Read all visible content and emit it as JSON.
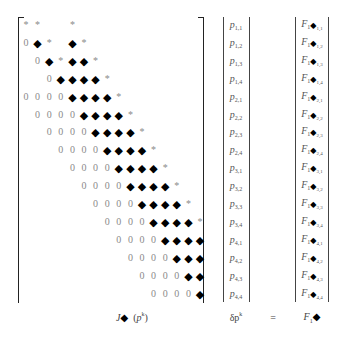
{
  "matrix": {
    "name": "J",
    "rows": [
      {
        "start": 0,
        "cells": [
          "*",
          "*",
          "",
          "",
          "*"
        ]
      },
      {
        "start": 0,
        "cells": [
          "0",
          "◆",
          "*",
          "",
          "◆",
          "*"
        ]
      },
      {
        "start": 1,
        "cells": [
          "0",
          "◆",
          "*",
          "◆",
          "◆",
          "*"
        ]
      },
      {
        "start": 2,
        "cells": [
          "0",
          "◆",
          "◆",
          "◆",
          "◆",
          "*"
        ]
      },
      {
        "start": 0,
        "cells": [
          "0",
          "0",
          "0",
          "0",
          "◆",
          "◆",
          "◆",
          "◆",
          "*"
        ]
      },
      {
        "start": 1,
        "cells": [
          "0",
          "0",
          "0",
          "0",
          "◆",
          "◆",
          "◆",
          "◆",
          "*"
        ]
      },
      {
        "start": 2,
        "cells": [
          "0",
          "0",
          "0",
          "0",
          "◆",
          "◆",
          "◆",
          "◆",
          "*"
        ]
      },
      {
        "start": 3,
        "cells": [
          "0",
          "0",
          "0",
          "0",
          "◆",
          "◆",
          "◆",
          "◆",
          "*"
        ]
      },
      {
        "start": 4,
        "cells": [
          "0",
          "0",
          "0",
          "0",
          "◆",
          "◆",
          "◆",
          "◆",
          "*"
        ]
      },
      {
        "start": 5,
        "cells": [
          "0",
          "0",
          "0",
          "0",
          "◆",
          "◆",
          "◆",
          "◆",
          "*"
        ]
      },
      {
        "start": 6,
        "cells": [
          "0",
          "0",
          "0",
          "0",
          "◆",
          "◆",
          "◆",
          "◆",
          "*"
        ]
      },
      {
        "start": 7,
        "cells": [
          "0",
          "0",
          "0",
          "0",
          "◆",
          "◆",
          "◆",
          "◆",
          "*"
        ]
      },
      {
        "start": 8,
        "cells": [
          "0",
          "0",
          "0",
          "0",
          "◆",
          "◆",
          "◆",
          "◆"
        ]
      },
      {
        "start": 9,
        "cells": [
          "0",
          "0",
          "0",
          "0",
          "◆",
          "◆",
          "◆"
        ]
      },
      {
        "start": 10,
        "cells": [
          "0",
          "0",
          "0",
          "0",
          "◆",
          "◆"
        ]
      },
      {
        "start": 11,
        "cells": [
          "0",
          "0",
          "0",
          "0",
          "◆"
        ]
      }
    ]
  },
  "delta_p_vector": {
    "symbol": "p",
    "entries": [
      "1,1",
      "1,2",
      "1,3",
      "1,4",
      "2,1",
      "2,2",
      "2,3",
      "2,4",
      "3,1",
      "3,2",
      "3,3",
      "3,4",
      "4,1",
      "4,2",
      "4,3",
      "4,4"
    ]
  },
  "f_vector": {
    "symbol": "F",
    "sub": "1",
    "marker": "◆",
    "entries": [
      "1,1",
      "1,2",
      "1,3",
      "1,4",
      "2,1",
      "2,2",
      "2,3",
      "2,4",
      "3,1",
      "3,2",
      "3,3",
      "3,4",
      "4,1",
      "4,2",
      "4,3",
      "4,4"
    ]
  },
  "labels": {
    "jacobian": {
      "name": "J",
      "marker": "◆",
      "arg_open": "(",
      "arg": "p",
      "arg_sup": "k",
      "arg_close": ")"
    },
    "delta_p": {
      "text": "δp",
      "sup": "k"
    },
    "equals": "=",
    "rhs": {
      "name": "F",
      "sub": "1",
      "marker": "◆"
    }
  }
}
